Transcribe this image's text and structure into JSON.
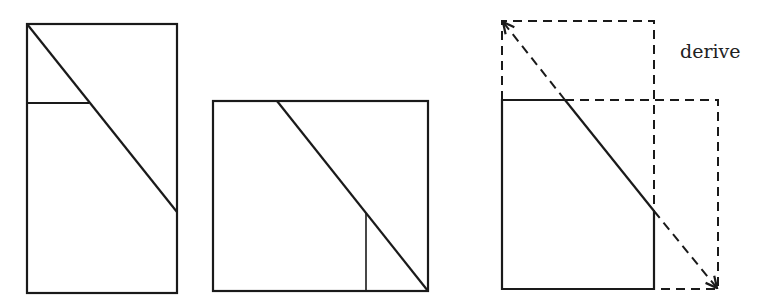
{
  "diagram": {
    "stroke_color": "#1a1a1a",
    "figures": [
      {
        "name": "tall-rectangle",
        "rect": {
          "x": 27,
          "y": 24,
          "w": 150,
          "h": 269
        },
        "diagonal": {
          "x1": 27,
          "y1": 24,
          "x2": 177,
          "y2": 212
        },
        "cut": {
          "x1": 27,
          "y1": 103,
          "x2": 89,
          "y2": 103
        }
      },
      {
        "name": "square",
        "rect": {
          "x": 213,
          "y": 101,
          "w": 215,
          "h": 190
        },
        "diagonal": {
          "x1": 277,
          "y1": 101,
          "x2": 428,
          "y2": 291
        },
        "cut": {
          "x1": 366,
          "y1": 213,
          "x2": 366,
          "y2": 291
        }
      },
      {
        "name": "derivation-overlay",
        "solid_rect": {
          "x": 502,
          "y": 100,
          "w": 152,
          "h": 189
        },
        "dashed_top_rect": {
          "x": 502,
          "y": 21,
          "w": 152,
          "h": 79
        },
        "dashed_right_rect": {
          "x": 654,
          "y": 100,
          "w": 64,
          "h": 189
        },
        "diagonal": {
          "x1": 502,
          "y1": 21,
          "x2": 718,
          "y2": 289
        },
        "solid_segment": {
          "x1": 565,
          "y1": 100,
          "x2": 654,
          "y2": 211
        }
      }
    ],
    "label": "derive"
  }
}
